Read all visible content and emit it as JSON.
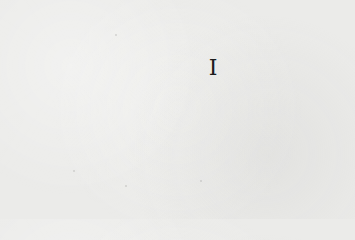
{
  "page": {
    "heading_numeral": "I",
    "background_color": "#ebebe9",
    "text_color": "#1c1c1c"
  }
}
